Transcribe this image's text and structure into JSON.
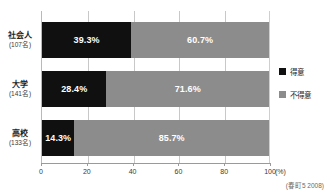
{
  "chart_data": {
    "type": "bar",
    "orientation": "horizontal",
    "stacked": true,
    "normalized_percent": true,
    "title": "",
    "xlabel": "(%)",
    "ylabel": "",
    "xlim": [
      0,
      100
    ],
    "grid": true,
    "legend_position": "right",
    "categories": [
      "社会人",
      "大学",
      "高校"
    ],
    "category_counts": [
      "(107名)",
      "(141名)",
      "(133名)"
    ],
    "series": [
      {
        "name": "得意",
        "color": "#101010",
        "values": [
          39.3,
          28.4,
          14.3
        ],
        "labels": [
          "39.3%",
          "28.4%",
          "14.3%"
        ]
      },
      {
        "name": "不得意",
        "color": "#8c8c8c",
        "values": [
          60.7,
          71.6,
          85.7
        ],
        "labels": [
          "60.7%",
          "71.6%",
          "85.7%"
        ]
      }
    ],
    "xticks": [
      0,
      20,
      40,
      60,
      80,
      100
    ],
    "xtick_labels": [
      "0",
      "20",
      "40",
      "60",
      "80",
      "100"
    ],
    "x_unit_label": "(%)",
    "source_note": "(春町5 2008)"
  },
  "legend": {
    "items": [
      {
        "label": "得意",
        "color": "#101010"
      },
      {
        "label": "不得意",
        "color": "#8c8c8c"
      }
    ]
  },
  "axis": {
    "unit": "(%)",
    "ticks": [
      "0",
      "20",
      "40",
      "60",
      "80",
      "100"
    ]
  },
  "rows": [
    {
      "name": "社会人",
      "count": "(107名)",
      "segments": [
        {
          "label": "39.3%",
          "value": 39.3,
          "series": "得意"
        },
        {
          "label": "60.7%",
          "value": 60.7,
          "series": "不得意"
        }
      ]
    },
    {
      "name": "大学",
      "count": "(141名)",
      "segments": [
        {
          "label": "28.4%",
          "value": 28.4,
          "series": "得意"
        },
        {
          "label": "71.6%",
          "value": 71.6,
          "series": "不得意"
        }
      ]
    },
    {
      "name": "高校",
      "count": "(133名)",
      "segments": [
        {
          "label": "85.7%",
          "value": 14.3,
          "series": "得意"
        },
        {
          "label": "85.7%",
          "value": 85.7,
          "series": "不得意"
        }
      ]
    }
  ],
  "footer": {
    "source": "(春町5 2008)"
  },
  "colors": {
    "series_dark": "#101010",
    "series_gray": "#8c8c8c",
    "gridline": "#c8c8c8",
    "axis": "#9a9a9a",
    "background": "#ffffff"
  }
}
